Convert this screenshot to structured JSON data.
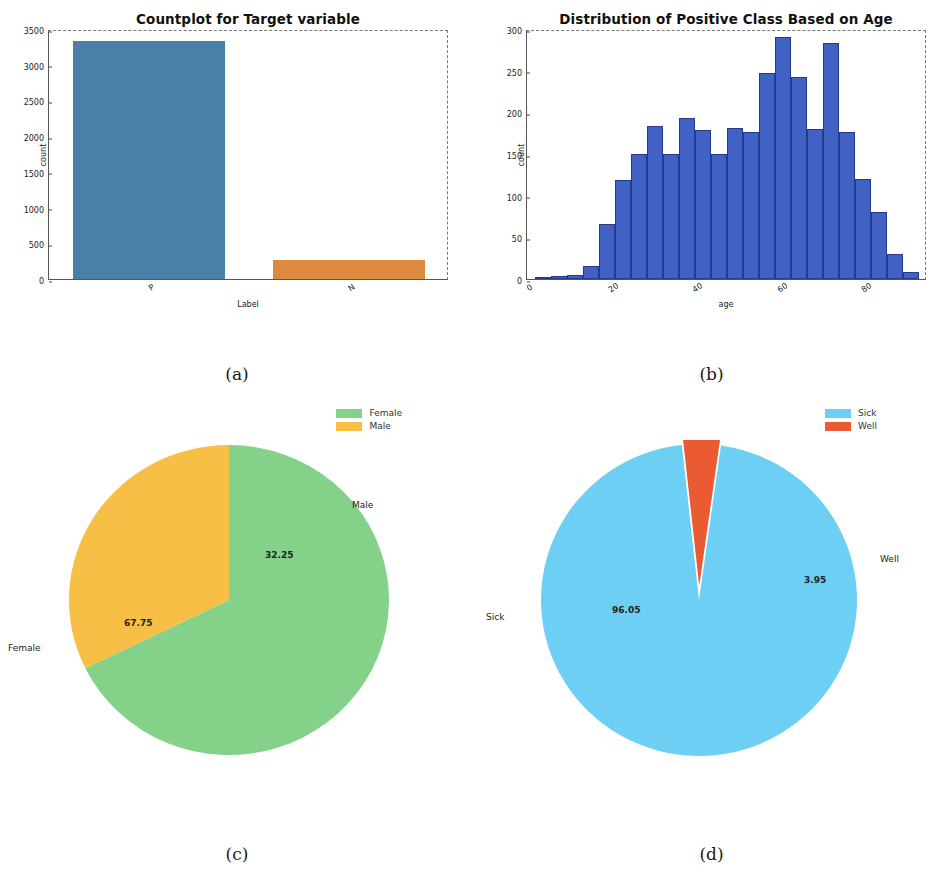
{
  "figure": {
    "captions": {
      "a": "(a)",
      "b": "(b)",
      "c": "(c)",
      "d": "(d)"
    }
  },
  "colors": {
    "countplot_p": "#4a7fa8",
    "countplot_n": "#dd8a40",
    "histogram": "#3f62c4",
    "histogram_edge": "#27398a",
    "female": "#84d18a",
    "male": "#f7bf45",
    "sick": "#6ecff5",
    "well": "#ea5a33"
  },
  "chart_data": [
    {
      "id": "countplot",
      "type": "bar",
      "title": "Countplot for Target variable",
      "xlabel": "Label",
      "ylabel": "count",
      "categories": [
        "P",
        "N"
      ],
      "values": [
        3330,
        270
      ],
      "ylim": [
        0,
        3500
      ],
      "yticks": [
        0,
        500,
        1000,
        1500,
        2000,
        2500,
        3000,
        3500
      ],
      "ytick_labels": [
        "0",
        "500",
        "1000",
        "1500",
        "2000",
        "2500",
        "3000",
        "3500"
      ],
      "grid": false,
      "legend": "none"
    },
    {
      "id": "age-histogram",
      "type": "bar",
      "title": "Distribution of Positive Class Based on Age",
      "xlabel": "age",
      "ylabel": "count",
      "xlim": [
        0,
        95
      ],
      "ylim": [
        0,
        300
      ],
      "yticks": [
        0,
        50,
        100,
        150,
        200,
        250,
        300
      ],
      "ytick_labels": [
        "0",
        "50",
        "100",
        "150",
        "200",
        "250",
        "300"
      ],
      "xticks": [
        0,
        20,
        40,
        60,
        80
      ],
      "xtick_labels": [
        "0",
        "20",
        "40",
        "60",
        "80"
      ],
      "bin_edges": [
        2,
        5.8,
        9.6,
        13.4,
        17.2,
        21,
        24.8,
        28.6,
        32.4,
        36.2,
        40,
        43.8,
        47.6,
        51.4,
        55.2,
        59,
        62.8,
        66.6,
        70.4,
        74.2,
        78,
        81.8,
        85.6,
        89.4,
        93.2
      ],
      "values": [
        0,
        4,
        5,
        16,
        66,
        119,
        150,
        184,
        150,
        193,
        179,
        150,
        181,
        176,
        247,
        290,
        242,
        180,
        283,
        176,
        120,
        80,
        30,
        8
      ],
      "grid": false,
      "legend": "none"
    },
    {
      "id": "sex-pie",
      "type": "pie",
      "title": "",
      "labels": [
        "Female",
        "Male"
      ],
      "values": [
        67.75,
        32.25
      ],
      "value_labels": [
        "67.75",
        "32.25"
      ],
      "colors": [
        "#84d18a",
        "#f7bf45"
      ],
      "legend": "upper-right",
      "legend_entries": [
        "Female",
        "Male"
      ]
    },
    {
      "id": "sick-pie",
      "type": "pie",
      "title": "",
      "labels": [
        "Sick",
        "Well"
      ],
      "values": [
        96.05,
        3.95
      ],
      "value_labels": [
        "96.05",
        "3.95"
      ],
      "colors": [
        "#6ecff5",
        "#ea5a33"
      ],
      "exploded": [
        "Well"
      ],
      "legend": "upper-right",
      "legend_entries": [
        "Sick",
        "Well"
      ]
    }
  ]
}
